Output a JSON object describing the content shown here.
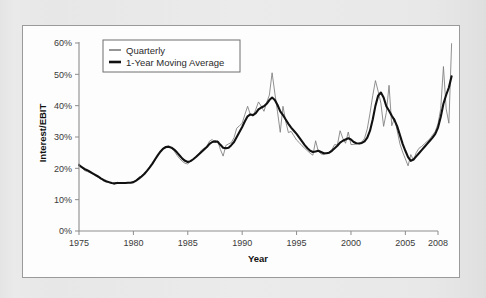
{
  "chart_data": {
    "type": "line",
    "title": "",
    "xlabel": "Year",
    "ylabel": "Interest/EBIT",
    "xlim": [
      1975,
      2008
    ],
    "ylim": [
      0,
      60
    ],
    "y_unit": "%",
    "grid": false,
    "legend_position": "top-left",
    "xticks": [
      "1975",
      "1980",
      "1985",
      "1990",
      "1995",
      "2000",
      "2005",
      "2008"
    ],
    "xtick_values": [
      1975,
      1980,
      1985,
      1990,
      1995,
      2000,
      2005,
      2008
    ],
    "yticks": [
      "0%",
      "10%",
      "20%",
      "30%",
      "40%",
      "50%",
      "60%"
    ],
    "ytick_values": [
      0,
      10,
      20,
      30,
      40,
      50,
      60
    ],
    "series": [
      {
        "name": "Quarterly",
        "color": "#7c7c7c",
        "width": "thin",
        "x": [
          1975.0,
          1975.25,
          1975.5,
          1975.75,
          1976.0,
          1976.25,
          1976.5,
          1976.75,
          1977.0,
          1977.25,
          1977.5,
          1977.75,
          1978.0,
          1978.25,
          1978.5,
          1978.75,
          1979.0,
          1979.25,
          1979.5,
          1979.75,
          1980.0,
          1980.25,
          1980.5,
          1980.75,
          1981.0,
          1981.25,
          1981.5,
          1981.75,
          1982.0,
          1982.25,
          1982.5,
          1982.75,
          1983.0,
          1983.25,
          1983.5,
          1983.75,
          1984.0,
          1984.25,
          1984.5,
          1984.75,
          1985.0,
          1985.25,
          1985.5,
          1985.75,
          1986.0,
          1986.25,
          1986.5,
          1986.75,
          1987.0,
          1987.25,
          1987.5,
          1987.75,
          1988.0,
          1988.25,
          1988.5,
          1988.75,
          1989.0,
          1989.25,
          1989.5,
          1989.75,
          1990.0,
          1990.25,
          1990.5,
          1990.75,
          1991.0,
          1991.25,
          1991.5,
          1991.75,
          1992.0,
          1992.25,
          1992.5,
          1992.75,
          1993.0,
          1993.25,
          1993.5,
          1993.75,
          1994.0,
          1994.25,
          1994.5,
          1994.75,
          1995.0,
          1995.25,
          1995.5,
          1995.75,
          1996.0,
          1996.25,
          1996.5,
          1996.75,
          1997.0,
          1997.25,
          1997.5,
          1997.75,
          1998.0,
          1998.25,
          1998.5,
          1998.75,
          1999.0,
          1999.25,
          1999.5,
          1999.75,
          2000.0,
          2000.25,
          2000.5,
          2000.75,
          2001.0,
          2001.25,
          2001.5,
          2001.75,
          2002.0,
          2002.25,
          2002.5,
          2002.75,
          2003.0,
          2003.25,
          2003.5,
          2003.75,
          2004.0,
          2004.25,
          2004.5,
          2004.75,
          2005.0,
          2005.25,
          2005.5,
          2005.75,
          2006.0,
          2006.25,
          2006.5,
          2006.75,
          2007.0,
          2007.25,
          2007.5,
          2007.75,
          2008.0,
          2008.25,
          2008.5,
          2008.75,
          2009.0,
          2009.25
        ],
        "y": [
          21.5,
          20.2,
          19.3,
          19.0,
          18.7,
          18.2,
          17.6,
          17.2,
          16.6,
          16.0,
          15.6,
          15.4,
          15.3,
          14.9,
          15.6,
          15.2,
          15.3,
          15.4,
          15.4,
          15.5,
          15.6,
          16.3,
          17.2,
          17.6,
          18.4,
          19.3,
          20.3,
          21.4,
          22.6,
          24.2,
          25.6,
          26.6,
          27.0,
          27.2,
          26.4,
          25.5,
          24.2,
          23.1,
          22.2,
          21.6,
          21.4,
          22.2,
          23.0,
          23.8,
          24.6,
          25.8,
          26.4,
          27.0,
          28.7,
          29.2,
          28.3,
          28.8,
          26.0,
          23.9,
          27.3,
          27.8,
          28.2,
          29.8,
          32.8,
          33.6,
          34.4,
          37.2,
          39.8,
          37.2,
          36.6,
          38.8,
          41.2,
          39.8,
          38.2,
          41.0,
          43.4,
          50.5,
          44.0,
          38.0,
          31.5,
          39.8,
          35.0,
          31.4,
          31.8,
          30.4,
          29.0,
          28.2,
          27.2,
          26.4,
          25.6,
          24.8,
          24.2,
          28.8,
          25.4,
          24.6,
          24.4,
          24.8,
          25.2,
          26.0,
          27.6,
          27.4,
          32.0,
          29.6,
          28.0,
          31.6,
          27.6,
          27.6,
          27.8,
          28.0,
          28.4,
          29.6,
          32.6,
          37.6,
          43.2,
          48.0,
          44.6,
          40.8,
          33.4,
          37.8,
          46.5,
          33.6,
          36.0,
          32.0,
          27.8,
          25.2,
          23.0,
          20.8,
          24.4,
          22.6,
          25.0,
          26.4,
          27.0,
          27.8,
          28.6,
          29.4,
          30.6,
          31.8,
          34.2,
          39.0,
          52.5,
          39.0,
          34.4,
          59.8
        ]
      },
      {
        "name": "1-Year Moving Average",
        "color": "#111111",
        "width": "thick",
        "x": [
          1975.0,
          1975.25,
          1975.5,
          1975.75,
          1976.0,
          1976.25,
          1976.5,
          1976.75,
          1977.0,
          1977.25,
          1977.5,
          1977.75,
          1978.0,
          1978.25,
          1978.5,
          1978.75,
          1979.0,
          1979.25,
          1979.5,
          1979.75,
          1980.0,
          1980.25,
          1980.5,
          1980.75,
          1981.0,
          1981.25,
          1981.5,
          1981.75,
          1982.0,
          1982.25,
          1982.5,
          1982.75,
          1983.0,
          1983.25,
          1983.5,
          1983.75,
          1984.0,
          1984.25,
          1984.5,
          1984.75,
          1985.0,
          1985.25,
          1985.5,
          1985.75,
          1986.0,
          1986.25,
          1986.5,
          1986.75,
          1987.0,
          1987.25,
          1987.5,
          1987.75,
          1988.0,
          1988.25,
          1988.5,
          1988.75,
          1989.0,
          1989.25,
          1989.5,
          1989.75,
          1990.0,
          1990.25,
          1990.5,
          1990.75,
          1991.0,
          1991.25,
          1991.5,
          1991.75,
          1992.0,
          1992.25,
          1992.5,
          1992.75,
          1993.0,
          1993.25,
          1993.5,
          1993.75,
          1994.0,
          1994.25,
          1994.5,
          1994.75,
          1995.0,
          1995.25,
          1995.5,
          1995.75,
          1996.0,
          1996.25,
          1996.5,
          1996.75,
          1997.0,
          1997.25,
          1997.5,
          1997.75,
          1998.0,
          1998.25,
          1998.5,
          1998.75,
          1999.0,
          1999.25,
          1999.5,
          1999.75,
          2000.0,
          2000.25,
          2000.5,
          2000.75,
          2001.0,
          2001.25,
          2001.5,
          2001.75,
          2002.0,
          2002.25,
          2002.5,
          2002.75,
          2003.0,
          2003.25,
          2003.5,
          2003.75,
          2004.0,
          2004.25,
          2004.5,
          2004.75,
          2005.0,
          2005.25,
          2005.5,
          2005.75,
          2006.0,
          2006.25,
          2006.5,
          2006.75,
          2007.0,
          2007.25,
          2007.5,
          2007.75,
          2008.0,
          2008.25,
          2008.5,
          2008.75,
          2009.0,
          2009.25
        ],
        "y": [
          21.0,
          20.4,
          19.8,
          19.4,
          18.9,
          18.4,
          17.9,
          17.4,
          16.8,
          16.3,
          15.9,
          15.6,
          15.3,
          15.2,
          15.3,
          15.3,
          15.3,
          15.3,
          15.4,
          15.4,
          15.6,
          16.1,
          16.7,
          17.4,
          18.2,
          19.2,
          20.3,
          21.5,
          22.9,
          24.2,
          25.4,
          26.3,
          26.8,
          26.9,
          26.6,
          26.0,
          25.1,
          24.1,
          23.1,
          22.4,
          22.0,
          22.3,
          22.9,
          23.6,
          24.4,
          25.2,
          26.0,
          26.8,
          27.8,
          28.4,
          28.6,
          28.5,
          27.5,
          26.6,
          26.4,
          26.6,
          27.4,
          28.4,
          30.0,
          31.6,
          33.2,
          35.0,
          36.6,
          37.2,
          37.0,
          37.6,
          38.8,
          39.4,
          39.8,
          40.6,
          41.8,
          42.6,
          41.8,
          40.2,
          38.2,
          37.0,
          35.6,
          34.2,
          33.0,
          32.0,
          31.0,
          29.8,
          28.6,
          27.4,
          26.4,
          25.6,
          25.2,
          25.4,
          25.6,
          25.2,
          24.8,
          24.8,
          25.0,
          25.6,
          26.4,
          27.2,
          28.2,
          28.8,
          29.2,
          29.6,
          29.2,
          28.4,
          28.0,
          27.9,
          28.1,
          28.6,
          29.8,
          32.0,
          35.6,
          40.0,
          43.2,
          44.2,
          42.6,
          39.8,
          38.4,
          36.8,
          35.4,
          33.4,
          30.6,
          27.8,
          25.6,
          23.6,
          22.4,
          22.8,
          23.8,
          24.8,
          25.8,
          26.8,
          27.8,
          28.8,
          29.8,
          31.0,
          33.0,
          36.4,
          40.6,
          43.4,
          45.8,
          49.4
        ]
      }
    ]
  },
  "legend": {
    "items": [
      {
        "label": "Quarterly"
      },
      {
        "label": "1-Year Moving Average"
      }
    ]
  }
}
